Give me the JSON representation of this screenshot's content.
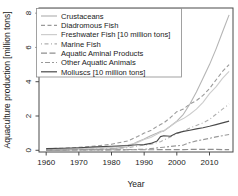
{
  "figure": {
    "background": "#ffffff",
    "axis_color": "#4a4a4a",
    "text_color": "#1a1a1a",
    "legend_border_color": "#8a8a8a"
  },
  "chart_data": {
    "type": "line",
    "title": "",
    "xlabel": "Year",
    "ylabel": "Aquaculture production [million tons]",
    "xlim": [
      1957.8,
      2017.2
    ],
    "ylim": [
      -0.1,
      8.3
    ],
    "x_ticks": [
      1960,
      1970,
      1980,
      1990,
      2000,
      2010
    ],
    "y_ticks": [
      0,
      2,
      4,
      6,
      8
    ],
    "grid": false,
    "legend_position": "top-left",
    "x": [
      1960,
      1965,
      1970,
      1975,
      1980,
      1985,
      1988,
      1990,
      1992,
      1994,
      1995,
      1996,
      1998,
      2000,
      2002,
      2004,
      2006,
      2008,
      2010,
      2012,
      2014,
      2016
    ],
    "series": [
      {
        "name": "Crustaceans",
        "color": "#b5b5b5",
        "dash": "",
        "values": [
          0.01,
          0.02,
          0.03,
          0.05,
          0.08,
          0.21,
          0.5,
          0.66,
          0.85,
          1.0,
          1.1,
          1.12,
          1.4,
          1.7,
          2.1,
          2.7,
          3.4,
          4.2,
          5.0,
          5.9,
          6.9,
          7.9
        ]
      },
      {
        "name": "Diadromous Fish",
        "color": "#9a9a9a",
        "dash": "4,2.5",
        "values": [
          0.09,
          0.12,
          0.17,
          0.25,
          0.35,
          0.55,
          0.8,
          1.0,
          1.15,
          1.4,
          1.5,
          1.6,
          1.9,
          2.25,
          2.4,
          2.7,
          2.9,
          3.2,
          3.6,
          4.1,
          4.6,
          5.0
        ]
      },
      {
        "name": "Freshwater Fish [10 million tons]",
        "color": "#cdcdcd",
        "dash": "",
        "values": [
          0.05,
          0.08,
          0.1,
          0.13,
          0.17,
          0.3,
          0.45,
          0.63,
          0.75,
          0.95,
          1.05,
          1.15,
          1.4,
          1.66,
          1.85,
          2.1,
          2.4,
          2.8,
          3.3,
          3.7,
          4.2,
          4.6
        ]
      },
      {
        "name": "Marine Fish",
        "color": "#b0b0b0",
        "dash": "1,2.5,4,2.5",
        "values": [
          0.02,
          0.03,
          0.05,
          0.07,
          0.1,
          0.15,
          0.25,
          0.3,
          0.35,
          0.45,
          0.5,
          0.6,
          0.78,
          0.97,
          1.1,
          1.3,
          1.45,
          1.6,
          1.8,
          2.1,
          2.4,
          2.7
        ]
      },
      {
        "name": "Aquatic Aminal Products",
        "color": "#8f8f8f",
        "dash": "6,2.5",
        "values": [
          0.01,
          0.01,
          0.02,
          0.02,
          0.02,
          0.03,
          0.03,
          0.03,
          0.03,
          0.04,
          0.04,
          0.04,
          0.04,
          0.04,
          0.04,
          0.05,
          0.05,
          0.05,
          0.05,
          0.05,
          0.04,
          0.04
        ]
      },
      {
        "name": "Other Aquatic Animals",
        "color": "#999999",
        "dash": "2,2,5,2",
        "values": [
          0.01,
          0.01,
          0.02,
          0.02,
          0.03,
          0.04,
          0.05,
          0.06,
          0.1,
          0.14,
          0.16,
          0.18,
          0.22,
          0.26,
          0.3,
          0.45,
          0.55,
          0.62,
          0.7,
          0.78,
          0.85,
          0.92
        ]
      },
      {
        "name": "Molluscs [10 million tons]",
        "color": "#4a4a4a",
        "dash": "",
        "values": [
          0.1,
          0.12,
          0.15,
          0.2,
          0.23,
          0.28,
          0.32,
          0.33,
          0.4,
          0.55,
          0.8,
          0.85,
          0.82,
          1.0,
          1.1,
          1.17,
          1.25,
          1.32,
          1.4,
          1.5,
          1.6,
          1.7
        ]
      }
    ]
  }
}
